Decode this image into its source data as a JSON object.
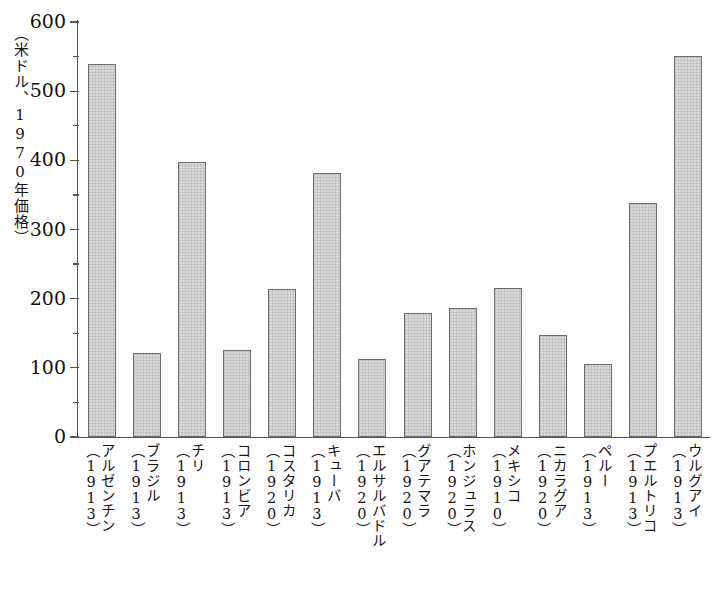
{
  "chart_data": {
    "type": "bar",
    "title": "",
    "subtitle": "",
    "xlabel": "",
    "ylabel": "（米ドル、1970年価格）",
    "ylim": [
      0,
      600
    ],
    "ytick_values": [
      0,
      100,
      200,
      300,
      400,
      500,
      600
    ],
    "ytick_labels": [
      "0",
      "100",
      "200",
      "300",
      "400",
      "500",
      "600"
    ],
    "yminor_values": [
      50,
      150,
      250,
      350,
      450,
      550
    ],
    "grid": false,
    "legend_position": "none",
    "bar_fill_color": "#d9d9d9",
    "bar_edge_color": "#6d6d6d",
    "axis_color": "#555555",
    "categories": [
      "アルゼンチン",
      "ブラジル",
      "チリ",
      "コロンビア",
      "コスタリカ",
      "キューバ",
      "エルサルバドル",
      "グアテマラ",
      "ホンジュラス",
      "メキシコ",
      "ニカラグア",
      "ペルー",
      "プエルトリコ",
      "ウルグアイ"
    ],
    "category_years": [
      "（1913）",
      "（1913）",
      "（1913）",
      "（1913）",
      "（1920）",
      "（1913）",
      "（1920）",
      "（1920）",
      "（1920）",
      "（1910）",
      "（1920）",
      "（1913）",
      "（1913）",
      "（1913）"
    ],
    "values": [
      540,
      121,
      398,
      126,
      214,
      381,
      113,
      179,
      187,
      216,
      148,
      105,
      338,
      551
    ]
  }
}
